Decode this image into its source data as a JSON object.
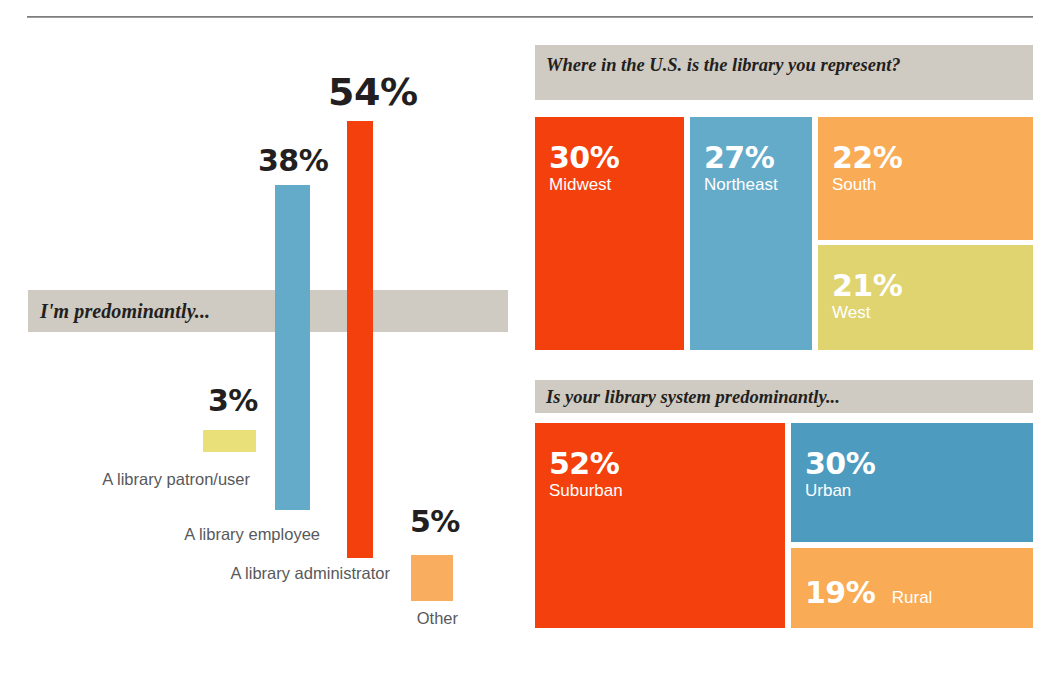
{
  "chart_data": [
    {
      "type": "bar",
      "title": "I'm predominantly...",
      "xlabel": "",
      "ylabel": "",
      "ylim": [
        0,
        60
      ],
      "grid": false,
      "legend": "none",
      "categories": [
        "A library patron/user",
        "A library employee",
        "A library administrator",
        "Other"
      ],
      "values": [
        3,
        38,
        54,
        5
      ],
      "value_labels": [
        "3%",
        "38%",
        "54%",
        "5%"
      ],
      "colors": [
        "#E9E07A",
        "#64ABCA",
        "#F4400C",
        "#F8AE5E"
      ]
    },
    {
      "type": "bar",
      "title": "Where in the U.S. is the library you represent?",
      "xlabel": "",
      "ylabel": "",
      "grid": false,
      "legend": "none",
      "categories": [
        "Midwest",
        "Northeast",
        "South",
        "West"
      ],
      "values": [
        30,
        27,
        22,
        21
      ],
      "value_labels": [
        "30%",
        "27%",
        "22%",
        "21%"
      ],
      "colors": [
        "#F4400C",
        "#64ABCA",
        "#F9AB55",
        "#E0D470"
      ]
    },
    {
      "type": "bar",
      "title": "Is your library system predominantly...",
      "xlabel": "",
      "ylabel": "",
      "grid": false,
      "legend": "none",
      "categories": [
        "Suburban",
        "Urban",
        "Rural"
      ],
      "values": [
        52,
        30,
        19
      ],
      "value_labels": [
        "52%",
        "30%",
        "19%"
      ],
      "colors": [
        "#F4400C",
        "#4E9BC0",
        "#F9AB55"
      ]
    }
  ],
  "palette": {
    "red": "#F4400C",
    "blue": "#64ABCA",
    "blue_dark": "#4E9BC0",
    "orange": "#F9AB55",
    "orange_light": "#F8AE5E",
    "yellow": "#E0D470",
    "yellow_light": "#E9E07A",
    "gray_band": "#CFCBC2",
    "text_dark": "#231F20",
    "text_gray": "#58595B",
    "white": "#FFFFFF"
  },
  "bar_chart": {
    "band_label": "I'm predominantly...",
    "bars": [
      {
        "value_label": "3%",
        "category": "A library patron/user"
      },
      {
        "value_label": "38%",
        "category": "A library employee"
      },
      {
        "value_label": "54%",
        "category": "A library administrator"
      },
      {
        "value_label": "5%",
        "category": "Other"
      }
    ]
  },
  "region_panel": {
    "header": "Where in the U.S. is the library you represent?",
    "blocks": [
      {
        "pct": "30%",
        "name": "Midwest"
      },
      {
        "pct": "27%",
        "name": "Northeast"
      },
      {
        "pct": "22%",
        "name": "South"
      },
      {
        "pct": "21%",
        "name": "West"
      }
    ]
  },
  "system_panel": {
    "header": "Is your library system predominantly...",
    "blocks": [
      {
        "pct": "52%",
        "name": "Suburban"
      },
      {
        "pct": "30%",
        "name": "Urban"
      },
      {
        "pct": "19%",
        "name": "Rural"
      }
    ]
  }
}
